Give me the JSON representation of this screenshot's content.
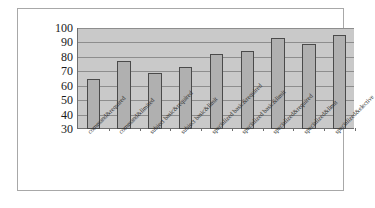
{
  "chart_data": {
    "type": "bar",
    "title": "",
    "subtitle": "",
    "xlabel": "",
    "ylabel": "",
    "ylim": [
      30,
      100
    ],
    "yticks": [
      100,
      90,
      80,
      70,
      60,
      50,
      40,
      30
    ],
    "grid": true,
    "legend": null,
    "categories": [
      "command&required",
      "command&limited",
      "subject basic&required",
      "subject basic&limit",
      "specialized basic&required",
      "specialized basic&limit",
      "specialized&required",
      "specialized&limit",
      "specialized&elective"
    ],
    "values": [
      65,
      77,
      69,
      73,
      82,
      84,
      93,
      89,
      95
    ],
    "series": [
      {
        "name": "",
        "values": [
          65,
          77,
          69,
          73,
          82,
          84,
          93,
          89,
          95
        ]
      }
    ],
    "colors": {
      "bar_fill": "#b0b0b0",
      "bar_border": "#4a4a4a",
      "plot_background": "#c9c9c9",
      "gridline": "#8d8d8d",
      "axis": "#6e6e6e",
      "frame": "#a8a8a8",
      "text": "#1a1a1a",
      "figure_background": "#ffffff"
    }
  }
}
